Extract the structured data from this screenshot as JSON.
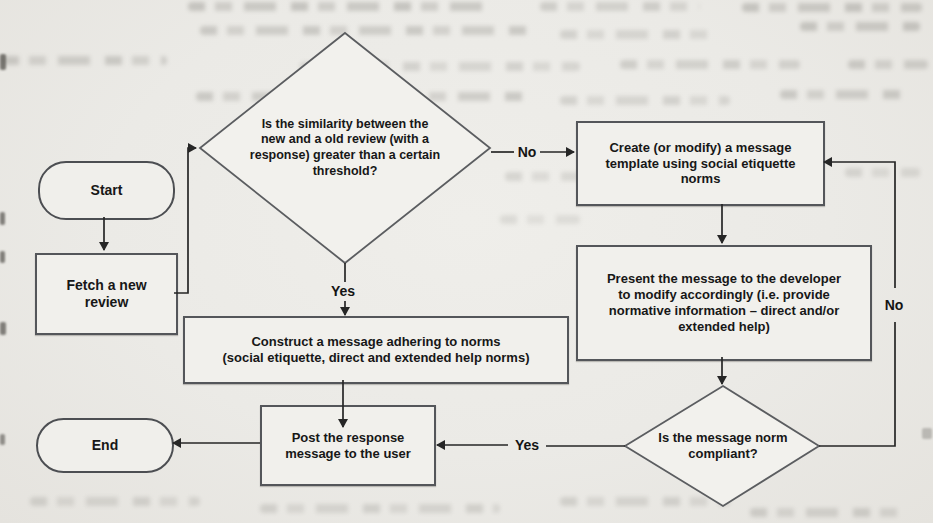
{
  "diagram": {
    "nodes": {
      "start": {
        "shape": "terminator",
        "label": "Start"
      },
      "fetch_review": {
        "shape": "process",
        "label": "Fetch a new\nreview"
      },
      "similarity_check": {
        "shape": "decision",
        "label": "Is the similarity between the\nnew and a old review (with a\nresponse) greater than a certain\nthreshold?"
      },
      "create_template": {
        "shape": "process",
        "label": "Create (or modify) a message\ntemplate using social etiquette\nnorms"
      },
      "present_message": {
        "shape": "process",
        "label": "Present the message to the developer\nto modify accordingly (i.e. provide\nnormative information – direct and/or\nextended help)"
      },
      "construct_message": {
        "shape": "process",
        "label": "Construct a message adhering to norms\n(social etiquette, direct and extended help norms)"
      },
      "norm_check": {
        "shape": "decision",
        "label": "Is the message norm\ncompliant?"
      },
      "post_response": {
        "shape": "process",
        "label": "Post the response\nmessage to the user"
      },
      "end": {
        "shape": "terminator",
        "label": "End"
      }
    },
    "edges": [
      {
        "from": "start",
        "to": "fetch_review",
        "label": ""
      },
      {
        "from": "fetch_review",
        "to": "similarity_check",
        "label": ""
      },
      {
        "from": "similarity_check",
        "to": "create_template",
        "label": "No"
      },
      {
        "from": "similarity_check",
        "to": "construct_message",
        "label": "Yes"
      },
      {
        "from": "create_template",
        "to": "present_message",
        "label": ""
      },
      {
        "from": "present_message",
        "to": "norm_check",
        "label": ""
      },
      {
        "from": "norm_check",
        "to": "post_response",
        "label": "Yes"
      },
      {
        "from": "norm_check",
        "to": "create_template",
        "label": "No"
      },
      {
        "from": "construct_message",
        "to": "post_response",
        "label": ""
      },
      {
        "from": "post_response",
        "to": "end",
        "label": ""
      }
    ],
    "colors": {
      "paper": "#ecebe7",
      "node_fill": "#f1f0ec",
      "node_border": "#54565a",
      "arrow": "#262626",
      "text": "#171717"
    }
  }
}
